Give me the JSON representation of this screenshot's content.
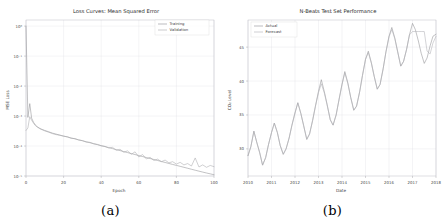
{
  "figure": {
    "panels": [
      {
        "caption": "(a)"
      },
      {
        "caption": "(b)"
      }
    ]
  },
  "chart_data": [
    {
      "type": "line",
      "panel": "a",
      "title": "Loss Curves: Mean Squared Error",
      "xlabel": "Epoch",
      "ylabel": "MSE Loss",
      "yscale": "log",
      "xlim": [
        0,
        100
      ],
      "ylim": [
        1e-05,
        1.6
      ],
      "grid": true,
      "legend_position": "upper right",
      "xticks": [
        0,
        20,
        40,
        60,
        80,
        100
      ],
      "xticklabels": [
        "0",
        "20",
        "40",
        "60",
        "80",
        "100"
      ],
      "yticks": [
        1e-05,
        0.0001,
        0.001,
        0.01,
        0.1,
        1
      ],
      "yticklabels": [
        "10⁻⁵",
        "10⁻⁴",
        "10⁻³",
        "10⁻²",
        "10⁻¹",
        "10⁰"
      ],
      "legend": [
        "Training",
        "Validation"
      ],
      "colors": {
        "training": "#8f8f93",
        "validation": "#a9a9ad"
      },
      "x": [
        0,
        1,
        2,
        3,
        4,
        5,
        6,
        7,
        8,
        9,
        10,
        12,
        14,
        16,
        18,
        20,
        22,
        24,
        26,
        28,
        30,
        32,
        34,
        36,
        38,
        40,
        42,
        44,
        46,
        48,
        50,
        52,
        54,
        56,
        58,
        60,
        62,
        64,
        66,
        68,
        70,
        72,
        74,
        76,
        78,
        80,
        82,
        84,
        86,
        88,
        90,
        92,
        94,
        96,
        98,
        100
      ],
      "series": [
        {
          "name": "Training",
          "values": [
            1.0,
            0.0009,
            0.0026,
            0.00085,
            0.00062,
            0.0005,
            0.00044,
            0.0004,
            0.00037,
            0.00035,
            0.00033,
            0.0003,
            0.00027,
            0.00025,
            0.00023,
            0.000215,
            0.0002,
            0.000186,
            0.000173,
            0.000161,
            0.00015,
            0.000139,
            0.000129,
            0.00012,
            0.000111,
            0.000103,
            9.55e-05,
            8.85e-05,
            8.2e-05,
            7.6e-05,
            7.04e-05,
            6.52e-05,
            6.04e-05,
            5.6e-05,
            5.19e-05,
            4.81e-05,
            4.46e-05,
            4.13e-05,
            3.83e-05,
            3.55e-05,
            3.29e-05,
            3.05e-05,
            2.83e-05,
            2.62e-05,
            2.43e-05,
            2.26e-05,
            2.1e-05,
            1.95e-05,
            1.81e-05,
            1.68e-05,
            1.56e-05,
            1.45e-05,
            1.35e-05,
            1.26e-05,
            1.18e-05,
            1.1e-05
          ]
        },
        {
          "name": "Validation",
          "values": [
            0.00033,
            0.0004,
            0.00095,
            0.00072,
            0.00058,
            0.00048,
            0.00043,
            0.00039,
            0.00036,
            0.00034,
            0.00032,
            0.00029,
            0.00026,
            0.00024,
            0.00023,
            0.000212,
            0.000205,
            0.00018,
            0.000178,
            0.000158,
            0.000152,
            0.000135,
            0.000133,
            0.000118,
            0.000113,
            0.000101,
            9.75e-05,
            8.6e-05,
            9.05e-05,
            7.2e-05,
            7.8e-05,
            6.2e-05,
            6.9e-05,
            5.3e-05,
            6.4e-05,
            4.3e-05,
            5.2e-05,
            3.7e-05,
            4.2e-05,
            3.3e-05,
            3.65e-05,
            3e-05,
            3.4e-05,
            2.75e-05,
            3e-05,
            2.5e-05,
            2.85e-05,
            2.35e-05,
            2.6e-05,
            2.15e-05,
            4e-05,
            2e-05,
            2.35e-05,
            1.95e-05,
            2.25e-05,
            2.05e-05
          ]
        }
      ]
    },
    {
      "type": "line",
      "panel": "b",
      "title": "N-Beats Test Set Performance",
      "xlabel": "Date",
      "ylabel": "CO₂ Level",
      "xlim": [
        2010,
        2018
      ],
      "ylim": [
        26,
        49
      ],
      "grid": true,
      "legend_position": "upper left",
      "xticks": [
        2010,
        2011,
        2012,
        2013,
        2014,
        2015,
        2016,
        2017,
        2018
      ],
      "xticklabels": [
        "2010",
        "2011",
        "2012",
        "2013",
        "2014",
        "2015",
        "2016",
        "2017",
        "2018"
      ],
      "yticks": [
        30,
        35,
        40,
        45
      ],
      "yticklabels": [
        "30",
        "35",
        "40",
        "45"
      ],
      "legend": [
        "Actual",
        "Forecast"
      ],
      "colors": {
        "actual": "#8f8f93",
        "forecast": "#b0b0b5"
      },
      "x": [
        2010.0,
        2010.12,
        2010.25,
        2010.37,
        2010.5,
        2010.62,
        2010.75,
        2010.87,
        2011.0,
        2011.12,
        2011.25,
        2011.37,
        2011.5,
        2011.62,
        2011.75,
        2011.87,
        2012.0,
        2012.12,
        2012.25,
        2012.37,
        2012.5,
        2012.62,
        2012.75,
        2012.87,
        2013.0,
        2013.12,
        2013.25,
        2013.37,
        2013.5,
        2013.62,
        2013.75,
        2013.87,
        2014.0,
        2014.12,
        2014.25,
        2014.37,
        2014.5,
        2014.62,
        2014.75,
        2014.87,
        2015.0,
        2015.12,
        2015.25,
        2015.37,
        2015.5,
        2015.62,
        2015.75,
        2015.87,
        2016.0,
        2016.12,
        2016.25,
        2016.37,
        2016.5,
        2016.62,
        2016.75,
        2016.87,
        2017.0,
        2017.12,
        2017.25,
        2017.37,
        2017.5,
        2017.62,
        2017.75,
        2017.87,
        2018.0
      ],
      "series": [
        {
          "name": "Actual",
          "values": [
            29.0,
            30.3,
            32.6,
            31.0,
            29.4,
            27.6,
            28.7,
            30.6,
            32.4,
            33.8,
            32.4,
            30.5,
            29.2,
            30.0,
            31.6,
            33.5,
            35.3,
            36.8,
            35.2,
            33.4,
            31.4,
            32.2,
            34.2,
            36.3,
            38.5,
            40.2,
            38.4,
            36.5,
            34.3,
            33.5,
            35.0,
            37.2,
            39.5,
            41.4,
            39.7,
            37.6,
            35.7,
            36.3,
            38.4,
            40.8,
            43.2,
            44.4,
            42.7,
            40.7,
            38.8,
            39.5,
            41.8,
            44.3,
            46.6,
            47.9,
            46.3,
            44.3,
            42.2,
            42.9,
            44.7,
            46.8,
            48.5,
            47.6,
            45.9,
            44.1,
            42.6,
            43.4,
            45.2,
            46.6,
            46.9
          ]
        },
        {
          "name": "Forecast",
          "values": [
            29.0,
            30.3,
            32.6,
            31.0,
            29.4,
            27.6,
            28.7,
            30.6,
            32.4,
            33.8,
            32.4,
            30.5,
            29.2,
            30.0,
            31.6,
            33.5,
            35.3,
            36.8,
            35.2,
            33.4,
            31.4,
            32.2,
            34.2,
            36.3,
            38.3,
            39.6,
            38.2,
            36.4,
            34.3,
            33.5,
            35.0,
            37.2,
            39.5,
            41.2,
            39.6,
            37.6,
            35.7,
            36.3,
            38.4,
            40.8,
            43.2,
            44.2,
            42.6,
            40.7,
            38.8,
            39.5,
            41.8,
            44.3,
            46.5,
            47.6,
            46.2,
            44.3,
            42.2,
            42.9,
            44.7,
            46.8,
            47.3,
            47.3,
            47.3,
            47.3,
            47.3,
            44.4,
            44.0,
            45.6,
            46.6
          ]
        }
      ]
    }
  ]
}
